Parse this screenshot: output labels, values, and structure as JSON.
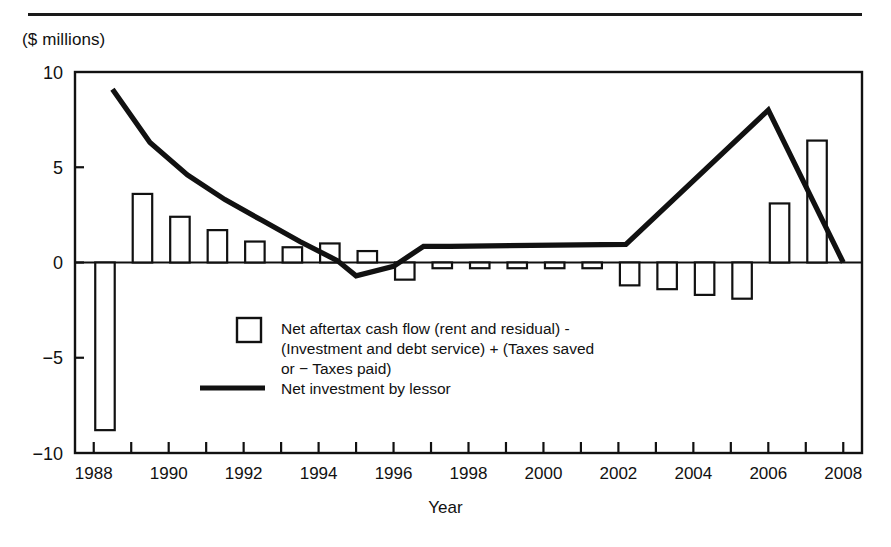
{
  "figure": {
    "units_label": "($ millions)",
    "x_axis_title": "Year"
  },
  "legend": {
    "items": [
      {
        "marker": "bar-swatch",
        "line1": "Net aftertax cash flow (rent and residual) -",
        "line2": "(Investment and debt service) + (Taxes saved",
        "line3": "or −  Taxes paid)"
      },
      {
        "marker": "line-swatch",
        "line1": "Net investment by lessor"
      }
    ]
  },
  "chart_data": {
    "type": "bar",
    "title": "",
    "xlabel": "Year",
    "ylabel": "($ millions)",
    "ylim": [
      -10,
      10
    ],
    "xlim": [
      1987.5,
      2008.5
    ],
    "yticks": [
      10,
      5,
      0,
      -5,
      -10
    ],
    "ytick_labels": [
      "10",
      "5",
      "0",
      "−5",
      "−10"
    ],
    "xticks": [
      1988,
      1989,
      1990,
      1991,
      1992,
      1993,
      1994,
      1995,
      1996,
      1997,
      1998,
      1999,
      2000,
      2001,
      2002,
      2003,
      2004,
      2005,
      2006,
      2007,
      2008
    ],
    "xtick_labels": [
      "1988",
      "",
      "1990",
      "",
      "1992",
      "",
      "1994",
      "",
      "1996",
      "",
      "1998",
      "",
      "2000",
      "",
      "2002",
      "",
      "2004",
      "",
      "2006",
      "",
      "2008"
    ],
    "grid": false,
    "legend_position": "inside-center",
    "categories": [
      1988,
      1989,
      1990,
      1991,
      1992,
      1993,
      1994,
      1995,
      1996,
      1997,
      1998,
      1999,
      2000,
      2001,
      2002,
      2003,
      2004,
      2005,
      2006,
      2007,
      2008
    ],
    "series": [
      {
        "name": "Net aftertax cash flow (rent and residual) - (Investment and debt service) + (Taxes saved or − Taxes paid)",
        "type": "bar",
        "color": "#ffffff",
        "edgecolor": "#111111",
        "values": [
          -8.8,
          3.6,
          2.4,
          1.7,
          1.1,
          0.8,
          1.0,
          0.6,
          -0.9,
          -0.3,
          -0.3,
          -0.3,
          -0.3,
          -0.3,
          -1.2,
          -1.4,
          -1.7,
          -1.9,
          3.1,
          6.4,
          0.0
        ]
      },
      {
        "name": "Net investment by lessor",
        "type": "line",
        "color": "#111111",
        "x": [
          1988.5,
          1989.5,
          1990.5,
          1991.5,
          1992.5,
          1993.5,
          1994.5,
          1995.0,
          1996.0,
          1996.8,
          1997.5,
          2002.2,
          2006.0,
          2008.0
        ],
        "values": [
          9.1,
          6.3,
          4.6,
          3.3,
          2.2,
          1.1,
          0.1,
          -0.7,
          -0.2,
          0.85,
          0.85,
          0.95,
          8.0,
          0.0
        ]
      }
    ]
  }
}
